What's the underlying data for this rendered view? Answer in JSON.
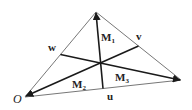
{
  "diagram": {
    "type": "triangle-with-medians",
    "colors": {
      "edge": "#777777",
      "median": "#1a1a1a",
      "background": "#ffffff"
    },
    "vertices": {
      "origin": {
        "x": 25,
        "y": 97,
        "label": "O"
      },
      "top": {
        "x": 96,
        "y": 12
      },
      "right": {
        "x": 181,
        "y": 80
      }
    },
    "side_labels": {
      "w": {
        "text": "w",
        "x": 50,
        "y": 51
      },
      "v": {
        "text": "v",
        "x": 136,
        "y": 40
      },
      "u": {
        "text": "u",
        "x": 107,
        "y": 99
      }
    },
    "region_labels": [
      {
        "main": "M",
        "sub": "1",
        "x": 103,
        "y": 41
      },
      {
        "main": "M",
        "sub": "2",
        "x": 73,
        "y": 89
      },
      {
        "main": "M",
        "sub": "3",
        "x": 115,
        "y": 82
      }
    ]
  }
}
